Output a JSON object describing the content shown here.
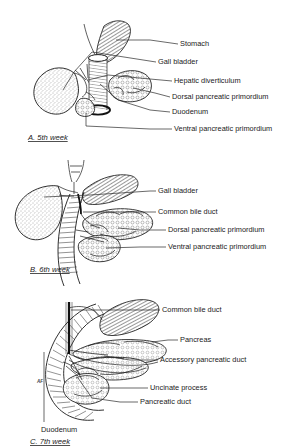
{
  "figure": {
    "background_color": "#ffffff",
    "ink_color": "#1a1a1a"
  },
  "panels": [
    {
      "id": "a",
      "caption": "A. 5th week",
      "labels": [
        {
          "text": "Stomach",
          "y": 44
        },
        {
          "text": "Gall bladder",
          "y": 62
        },
        {
          "text": "Hepatic diverticulum",
          "y": 81
        },
        {
          "text": "Dorsal pancreatic primordium",
          "y": 97
        },
        {
          "text": "Duodenum",
          "y": 112
        },
        {
          "text": "Ventral pancreatic primordium",
          "y": 129
        }
      ]
    },
    {
      "id": "b",
      "caption": "B. 6th week",
      "labels": [
        {
          "text": "Gall bladder",
          "y": 41
        },
        {
          "text": "Common bile duct",
          "y": 62
        },
        {
          "text": "Dorsal pancreatic primordium",
          "y": 80
        },
        {
          "text": "Ventral pancreatic primordium",
          "y": 97
        }
      ]
    },
    {
      "id": "c",
      "caption": "C. 7th week",
      "labels": [
        {
          "text": "Common bile duct",
          "y": 20
        },
        {
          "text": "Pancreas",
          "y": 50
        },
        {
          "text": "Accessory pancreatic duct",
          "y": 70
        },
        {
          "text": "Uncinate process",
          "y": 98
        },
        {
          "text": "Pancreatic duct",
          "y": 112
        },
        {
          "text": "Duodenum",
          "y": 138
        }
      ]
    }
  ],
  "signature": "AF"
}
